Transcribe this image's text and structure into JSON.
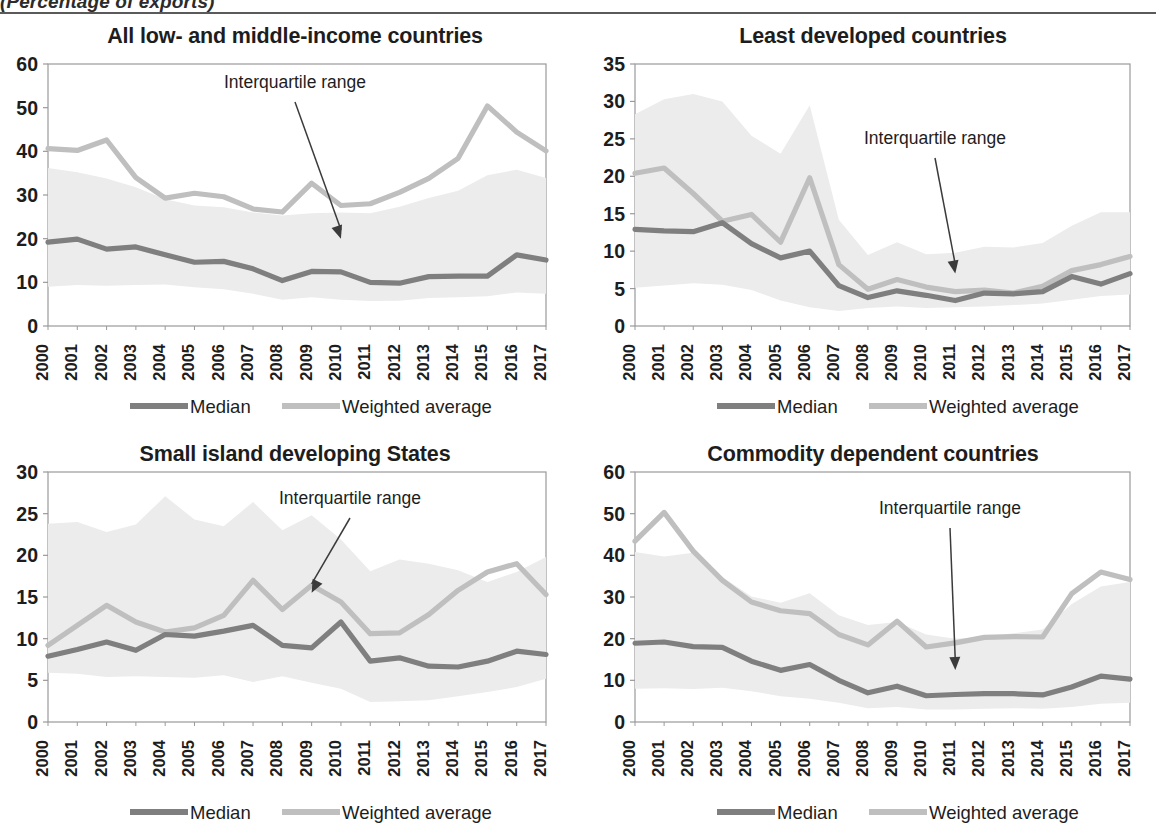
{
  "figure": {
    "caption": "(Percentage of exports)",
    "years": [
      "2000",
      "2001",
      "2002",
      "2003",
      "2004",
      "2005",
      "2006",
      "2007",
      "2008",
      "2009",
      "2010",
      "2011",
      "2012",
      "2013",
      "2014",
      "2015",
      "2016",
      "2017"
    ],
    "legend": {
      "median_label": "Median",
      "weighted_label": "Weighted average",
      "median_color": "#7f7f7f",
      "weighted_color": "#bfbfbf",
      "band_color": "#ececec"
    },
    "annotation_label": "Interquartile range"
  },
  "chart_data": [
    {
      "id": "all-low-and-middle-income-countries",
      "type": "line",
      "title": "All low- and middle-income countries",
      "xlabel": "",
      "ylabel": "",
      "ylim": [
        0,
        60
      ],
      "yticks": [
        0,
        10,
        20,
        30,
        40,
        50,
        60
      ],
      "grid": false,
      "legend_position": "bottom",
      "x": [
        "2000",
        "2001",
        "2002",
        "2003",
        "2004",
        "2005",
        "2006",
        "2007",
        "2008",
        "2009",
        "2010",
        "2011",
        "2012",
        "2013",
        "2014",
        "2015",
        "2016",
        "2017"
      ],
      "series": [
        {
          "name": "Median",
          "values": [
            19.2,
            19.9,
            17.6,
            18.1,
            16.3,
            14.6,
            14.8,
            13.1,
            10.4,
            12.5,
            12.4,
            10.0,
            9.8,
            11.3,
            11.4,
            11.4,
            16.3,
            15.1
          ]
        },
        {
          "name": "Weighted average",
          "values": [
            40.6,
            40.2,
            42.6,
            34.0,
            29.3,
            30.4,
            29.6,
            26.8,
            26.1,
            32.7,
            27.6,
            28.0,
            30.6,
            33.8,
            38.4,
            50.4,
            44.4,
            40.1
          ]
        },
        {
          "name": "Interquartile range upper",
          "values": [
            36.2,
            35.2,
            33.8,
            31.8,
            29.0,
            27.6,
            27.2,
            26.0,
            25.3,
            25.8,
            26.0,
            25.8,
            27.3,
            29.3,
            31.0,
            34.5,
            35.8,
            33.9
          ]
        },
        {
          "name": "Interquartile range lower",
          "values": [
            9.0,
            9.4,
            9.2,
            9.4,
            9.5,
            8.9,
            8.4,
            7.4,
            6.0,
            6.6,
            6.0,
            5.7,
            5.8,
            6.4,
            6.6,
            6.8,
            7.7,
            7.4
          ]
        }
      ],
      "annotation": {
        "text": "Interquartile range",
        "points_to_year": "2010",
        "points_to_value": 20.0
      }
    },
    {
      "id": "least-developed-countries",
      "type": "line",
      "title": "Least developed countries",
      "xlabel": "",
      "ylabel": "",
      "ylim": [
        0,
        35
      ],
      "yticks": [
        0,
        5,
        10,
        15,
        20,
        25,
        30,
        35
      ],
      "grid": false,
      "legend_position": "bottom",
      "x": [
        "2000",
        "2001",
        "2002",
        "2003",
        "2004",
        "2005",
        "2006",
        "2007",
        "2008",
        "2009",
        "2010",
        "2011",
        "2012",
        "2013",
        "2014",
        "2015",
        "2016",
        "2017"
      ],
      "series": [
        {
          "name": "Median",
          "values": [
            12.9,
            12.7,
            12.6,
            13.8,
            11.0,
            9.1,
            10.0,
            5.4,
            3.8,
            4.7,
            4.1,
            3.4,
            4.4,
            4.3,
            4.6,
            6.6,
            5.6,
            7.0
          ]
        },
        {
          "name": "Weighted average",
          "values": [
            20.4,
            21.1,
            17.7,
            14.0,
            14.9,
            11.2,
            19.8,
            8.2,
            4.9,
            6.2,
            5.2,
            4.6,
            4.8,
            4.4,
            5.3,
            7.4,
            8.2,
            9.3
          ]
        },
        {
          "name": "Interquartile range upper",
          "values": [
            28.3,
            30.3,
            31.0,
            30.0,
            25.4,
            23.0,
            29.5,
            14.2,
            9.5,
            11.2,
            9.6,
            9.8,
            10.6,
            10.5,
            11.1,
            13.4,
            15.2,
            15.2
          ]
        },
        {
          "name": "Interquartile range lower",
          "values": [
            5.1,
            5.4,
            5.7,
            5.5,
            4.8,
            3.4,
            2.5,
            2.0,
            2.4,
            2.6,
            2.4,
            2.5,
            2.6,
            2.8,
            3.0,
            3.5,
            4.0,
            4.2
          ]
        }
      ],
      "annotation": {
        "text": "Interquartile range",
        "points_to_year": "2011",
        "points_to_value": 7.0
      }
    },
    {
      "id": "small-island-developing-states",
      "type": "line",
      "title": "Small island developing States",
      "xlabel": "",
      "ylabel": "",
      "ylim": [
        0,
        30
      ],
      "yticks": [
        0,
        5,
        10,
        15,
        20,
        25,
        30
      ],
      "grid": false,
      "legend_position": "bottom",
      "x": [
        "2000",
        "2001",
        "2002",
        "2003",
        "2004",
        "2005",
        "2006",
        "2007",
        "2008",
        "2009",
        "2010",
        "2011",
        "2012",
        "2013",
        "2014",
        "2015",
        "2016",
        "2017"
      ],
      "series": [
        {
          "name": "Median",
          "values": [
            7.9,
            8.7,
            9.6,
            8.6,
            10.5,
            10.3,
            10.9,
            11.6,
            9.2,
            8.9,
            12.0,
            7.3,
            7.7,
            6.7,
            6.6,
            7.3,
            8.5,
            8.1
          ]
        },
        {
          "name": "Weighted average",
          "values": [
            9.2,
            11.6,
            14.0,
            12.0,
            10.8,
            11.3,
            12.8,
            17.0,
            13.5,
            16.4,
            14.4,
            10.6,
            10.7,
            12.9,
            15.8,
            18.0,
            19.0,
            15.3
          ]
        },
        {
          "name": "Interquartile range upper",
          "values": [
            23.8,
            24.0,
            22.8,
            23.7,
            27.1,
            24.3,
            23.5,
            26.4,
            23.0,
            24.8,
            21.9,
            18.1,
            19.5,
            19.0,
            18.2,
            16.8,
            18.0,
            19.8
          ]
        },
        {
          "name": "Interquartile range lower",
          "values": [
            5.9,
            5.8,
            5.4,
            5.5,
            5.4,
            5.3,
            5.6,
            4.8,
            5.5,
            4.7,
            4.0,
            2.4,
            2.5,
            2.6,
            3.1,
            3.6,
            4.2,
            5.2
          ]
        }
      ],
      "annotation": {
        "text": "Interquartile range",
        "points_to_year": "2009",
        "points_to_value": 15.5
      }
    },
    {
      "id": "commodity-dependent-countries",
      "type": "line",
      "title": "Commodity dependent countries",
      "xlabel": "",
      "ylabel": "",
      "ylim": [
        0,
        60
      ],
      "yticks": [
        0,
        10,
        20,
        30,
        40,
        50,
        60
      ],
      "grid": false,
      "legend_position": "bottom",
      "x": [
        "2000",
        "2001",
        "2002",
        "2003",
        "2004",
        "2005",
        "2006",
        "2007",
        "2008",
        "2009",
        "2010",
        "2011",
        "2012",
        "2013",
        "2014",
        "2015",
        "2016",
        "2017"
      ],
      "series": [
        {
          "name": "Median",
          "values": [
            18.9,
            19.2,
            18.1,
            17.9,
            14.6,
            12.4,
            13.8,
            10.0,
            7.0,
            8.6,
            6.3,
            6.6,
            6.8,
            6.8,
            6.5,
            8.4,
            11.0,
            10.3
          ]
        },
        {
          "name": "Weighted average",
          "values": [
            43.4,
            50.3,
            41.0,
            34.0,
            28.8,
            26.7,
            26.0,
            21.0,
            18.5,
            24.2,
            18.0,
            19.0,
            20.3,
            20.5,
            20.4,
            30.8,
            36.0,
            34.2
          ]
        },
        {
          "name": "Interquartile range upper",
          "values": [
            40.8,
            39.7,
            40.6,
            34.8,
            30.1,
            28.6,
            30.9,
            25.6,
            23.3,
            24.0,
            21.0,
            20.0,
            20.4,
            21.3,
            22.2,
            28.3,
            32.5,
            33.6
          ]
        },
        {
          "name": "Interquartile range lower",
          "values": [
            8.0,
            8.1,
            7.9,
            8.2,
            7.4,
            6.2,
            5.6,
            4.6,
            3.3,
            3.6,
            3.0,
            3.0,
            3.2,
            3.3,
            3.2,
            3.6,
            4.4,
            4.6
          ]
        }
      ],
      "annotation": {
        "text": "Interquartile range",
        "points_to_year": "2011",
        "points_to_value": 12.5
      }
    }
  ]
}
